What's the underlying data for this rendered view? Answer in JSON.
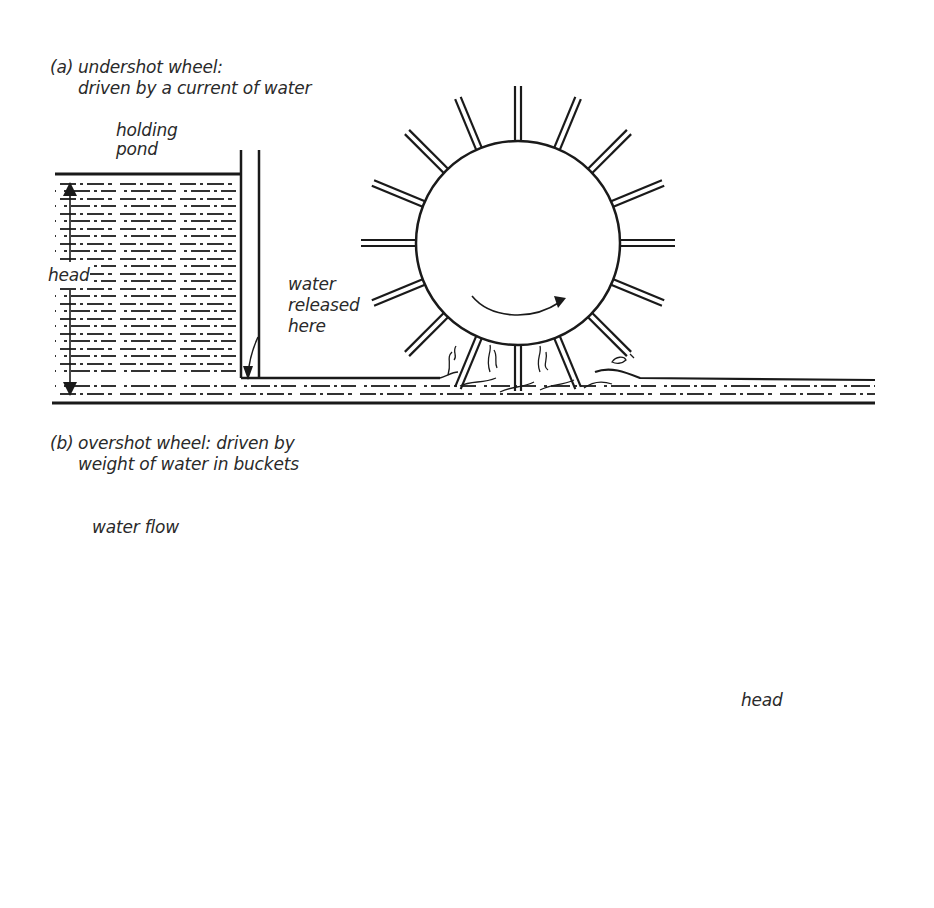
{
  "figure": {
    "panel_a": {
      "tag": "(a)",
      "title_line1": "undershot wheel:",
      "title_line2": "driven by a current of water",
      "labels": {
        "holding_pond_1": "holding",
        "holding_pond_2": "pond",
        "head": "head",
        "water_released_1": "water",
        "water_released_2": "released",
        "water_released_3": "here"
      },
      "wheel": {
        "type": "undershot",
        "paddles": 16,
        "rotation": "clockwise"
      }
    },
    "panel_b": {
      "tag": "(b)",
      "title_line1": "overshot wheel: driven by",
      "title_line2": "weight of water in buckets",
      "labels": {
        "water_flow": "water flow",
        "head": "head"
      },
      "wheel": {
        "type": "overshot",
        "buckets": 24,
        "rotation": "counterclockwise"
      }
    },
    "colors": {
      "ink": "#1a1a1a",
      "background": "#ffffff"
    }
  }
}
